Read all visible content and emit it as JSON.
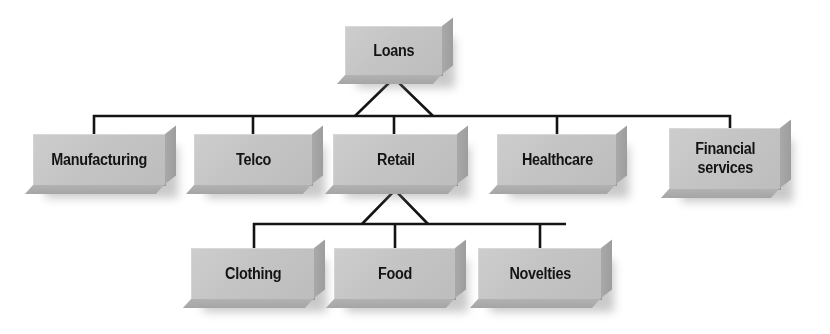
{
  "diagram": {
    "type": "hierarchy-tree",
    "background_color": "#ffffff",
    "node_face_color": "#c6c6c6",
    "node_bevel_color": "#a2a2a2",
    "line_color": "#141414",
    "levels": 3,
    "root": {
      "id": "loans",
      "label": "Loans",
      "x": 345,
      "y": 26,
      "width": 98,
      "height": 50
    },
    "level2": [
      {
        "id": "manufacturing",
        "label": "Manufacturing",
        "x": 33,
        "y": 134,
        "width": 133,
        "height": 52
      },
      {
        "id": "telco",
        "label": "Telco",
        "x": 194,
        "y": 134,
        "width": 119,
        "height": 52
      },
      {
        "id": "retail",
        "label": "Retail",
        "x": 333,
        "y": 134,
        "width": 125,
        "height": 52
      },
      {
        "id": "healthcare",
        "label": "Healthcare",
        "x": 497,
        "y": 134,
        "width": 120,
        "height": 52
      },
      {
        "id": "financial-services",
        "label": "Financial\nservices",
        "x": 669,
        "y": 128,
        "width": 112,
        "height": 62
      }
    ],
    "level3": [
      {
        "id": "clothing",
        "label": "Clothing",
        "x": 191,
        "y": 248,
        "width": 124,
        "height": 52
      },
      {
        "id": "food",
        "label": "Food",
        "x": 334,
        "y": 248,
        "width": 122,
        "height": 52
      },
      {
        "id": "novelties",
        "label": "Novelties",
        "x": 478,
        "y": 248,
        "width": 124,
        "height": 52
      }
    ],
    "connectors": {
      "top_bus": {
        "y": 116,
        "x_start": 93,
        "x_end": 731
      },
      "top_fan": {
        "apex_x": 394,
        "apex_y": 78,
        "left_x": 355,
        "right_x": 433,
        "stub_x": 394,
        "stub_bottom": 134
      },
      "top_drops": [
        93,
        253,
        394,
        557,
        731
      ],
      "bottom_bus": {
        "y": 224,
        "x_start": 253,
        "x_end": 566
      },
      "bottom_fan": {
        "apex_x": 395,
        "apex_y": 190,
        "left_x": 362,
        "right_x": 428,
        "stub_x": 395,
        "stub_bottom": 248
      },
      "bottom_drops": [
        253,
        395,
        540
      ]
    }
  }
}
